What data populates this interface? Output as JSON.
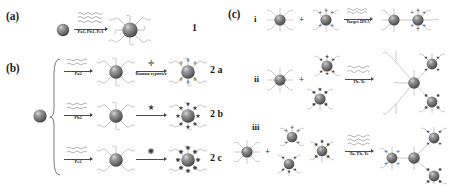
{
  "figure": {
    "background": "#ffffff",
    "ink": "#2b2b2b",
    "particle_core": "#7b7b7b",
    "particle_shade": "#4f4f4f",
    "dna_color": "#b9b9b9",
    "type": "reaction-scheme"
  },
  "panels": {
    "a": {
      "letter": "(a)",
      "reagent_label": "Pa1, Pb1, Pc1",
      "product_label": "1",
      "start_particle": "bare-gold-nanoparticle",
      "product_particle": "dna-functionalized-nanoparticle"
    },
    "b": {
      "letter": "(b)",
      "start_particle": "bare-gold-nanoparticle",
      "second_arrow_label": "Raman reporter",
      "rows": [
        {
          "probe": "Pa2",
          "reporter_icon": "plus-cross-reporter",
          "reporter_glyph": "✛",
          "product_label": "2 a"
        },
        {
          "probe": "Pb2",
          "reporter_icon": "star-reporter",
          "reporter_glyph": "★",
          "product_label": "2 b"
        },
        {
          "probe": "Pc2",
          "reporter_icon": "flower-reporter",
          "reporter_glyph": "✺",
          "product_label": "2 c"
        }
      ]
    },
    "c": {
      "letter": "(c)",
      "rows": [
        {
          "numeral": "i",
          "arrow_above": "Ta",
          "arrow_below": "Target DNA",
          "assembly": "dimer"
        },
        {
          "numeral": "ii",
          "arrow_above": "",
          "arrow_below": "Tb, Tc",
          "assembly": "trimer"
        },
        {
          "numeral": "iii",
          "arrow_above": "",
          "arrow_below": "Ta, Tb, Tc",
          "assembly": "tetramer"
        }
      ],
      "plus_symbol": "+"
    }
  }
}
